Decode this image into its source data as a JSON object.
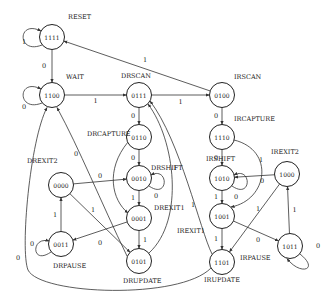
{
  "diagram": {
    "type": "state-machine",
    "states": [
      {
        "id": "1111",
        "name": "RESET"
      },
      {
        "id": "1100",
        "name": "WAIT"
      },
      {
        "id": "0111",
        "name": "DRSCAN"
      },
      {
        "id": "0100",
        "name": "IRSCAN"
      },
      {
        "id": "0110",
        "name": "DRCAPTURE"
      },
      {
        "id": "0010",
        "name": "DRSHIFT"
      },
      {
        "id": "0001",
        "name": "DREXIT1"
      },
      {
        "id": "0101",
        "name": "DRUPDATE"
      },
      {
        "id": "0000",
        "name": "DREXIT2"
      },
      {
        "id": "0011",
        "name": "DRPAUSE"
      },
      {
        "id": "1110",
        "name": "IRCAPTURE"
      },
      {
        "id": "1010",
        "name": "IRSHIFT"
      },
      {
        "id": "1001",
        "name": "IREXIT1"
      },
      {
        "id": "1101",
        "name": "IRUPDATE"
      },
      {
        "id": "1000",
        "name": "IREXIT2"
      },
      {
        "id": "1011",
        "name": "IRPAUSE"
      }
    ],
    "transitions": [
      {
        "from": "1111",
        "to": "1111",
        "label": "1"
      },
      {
        "from": "1111",
        "to": "1100",
        "label": "0"
      },
      {
        "from": "1100",
        "to": "1100",
        "label": "0"
      },
      {
        "from": "1100",
        "to": "0111",
        "label": "1"
      },
      {
        "from": "0111",
        "to": "0100",
        "label": "1"
      },
      {
        "from": "0111",
        "to": "0110",
        "label": "0"
      },
      {
        "from": "0100",
        "to": "1111",
        "label": "1"
      },
      {
        "from": "0100",
        "to": "1110",
        "label": "0"
      },
      {
        "from": "0110",
        "to": "0010",
        "label": "0"
      },
      {
        "from": "0110",
        "to": "0001",
        "label": "1"
      },
      {
        "from": "0010",
        "to": "0010",
        "label": "0"
      },
      {
        "from": "0010",
        "to": "0001",
        "label": "1"
      },
      {
        "from": "0001",
        "to": "0101",
        "label": "1"
      },
      {
        "from": "0001",
        "to": "0011",
        "label": "0"
      },
      {
        "from": "0011",
        "to": "0011",
        "label": "0"
      },
      {
        "from": "0011",
        "to": "0000",
        "label": "1"
      },
      {
        "from": "0000",
        "to": "0010",
        "label": "0"
      },
      {
        "from": "0000",
        "to": "0101",
        "label": "1"
      },
      {
        "from": "0101",
        "to": "1100",
        "label": "0"
      },
      {
        "from": "0101",
        "to": "0111",
        "label": "1"
      },
      {
        "from": "1110",
        "to": "1010",
        "label": "0"
      },
      {
        "from": "1110",
        "to": "1001",
        "label": "1"
      },
      {
        "from": "1010",
        "to": "1010",
        "label": "0"
      },
      {
        "from": "1010",
        "to": "1001",
        "label": "1"
      },
      {
        "from": "1001",
        "to": "1101",
        "label": "1"
      },
      {
        "from": "1001",
        "to": "1011",
        "label": "0"
      },
      {
        "from": "1011",
        "to": "1011",
        "label": "0"
      },
      {
        "from": "1011",
        "to": "1000",
        "label": "1"
      },
      {
        "from": "1000",
        "to": "1010",
        "label": "0"
      },
      {
        "from": "1000",
        "to": "1101",
        "label": "1"
      },
      {
        "from": "1101",
        "to": "0111",
        "label": "1"
      },
      {
        "from": "1101",
        "to": "1100",
        "label": "0"
      }
    ]
  }
}
